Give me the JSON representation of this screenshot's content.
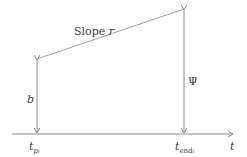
{
  "diagram": {
    "colors": {
      "line": "#8a8a8a",
      "text": "#3a3a3a"
    },
    "labels": {
      "slope": "Slope ",
      "slope_var": "r",
      "b": "b",
      "psi": "Ψ",
      "t_axis": "t",
      "t_p": "t",
      "t_p_sub": "p",
      "t_p_subsub": "i",
      "t_end": "t",
      "t_end_sub": "end",
      "t_end_subsub": "i"
    }
  }
}
